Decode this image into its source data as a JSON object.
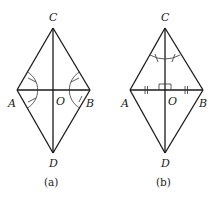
{
  "figures": [
    {
      "id": "a",
      "caption": "(a)",
      "labels": {
        "C": "C",
        "A": "A",
        "O": "O",
        "B": "B",
        "D": "D"
      },
      "vertices": {
        "C": [
          53,
          28
        ],
        "A": [
          17,
          90
        ],
        "B": [
          90,
          90
        ],
        "D": [
          53,
          153
        ],
        "O": [
          53,
          90
        ]
      },
      "segments": [
        "CA",
        "CB",
        "AD",
        "BD",
        "AB",
        "CD"
      ],
      "marks": [
        "angle arc at A with single ticks (angle CAO = angle DAO)",
        "angle arc at B with single ticks (angle CBO = angle DBO)"
      ]
    },
    {
      "id": "b",
      "caption": "(b)",
      "labels": {
        "C": "C",
        "A": "A",
        "O": "O",
        "B": "B",
        "D": "D"
      },
      "vertices": {
        "C": [
          165,
          28
        ],
        "A": [
          130,
          90
        ],
        "B": [
          203,
          90
        ],
        "D": [
          165,
          153
        ],
        "O": [
          165,
          90
        ]
      },
      "segments": [
        "CA",
        "CB",
        "AD",
        "BD",
        "AB",
        "CD"
      ],
      "marks": [
        "double ticks on AO and OB (AO = OB)",
        "right angle mark at O",
        "angle arc at C with single ticks (angle ACO = angle BCO)"
      ]
    }
  ]
}
